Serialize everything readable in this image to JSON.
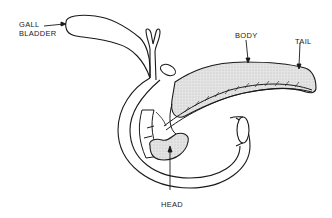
{
  "diagram": {
    "labels": {
      "gall_bladder_line1": "GALL",
      "gall_bladder_line2": "BLADDER",
      "body": "BODY",
      "tail": "TAIL",
      "head": "HEAD"
    },
    "colors": {
      "outline": "#1a1a1a",
      "pancreas_fill": "#dcdcdc",
      "background": "#ffffff"
    }
  }
}
